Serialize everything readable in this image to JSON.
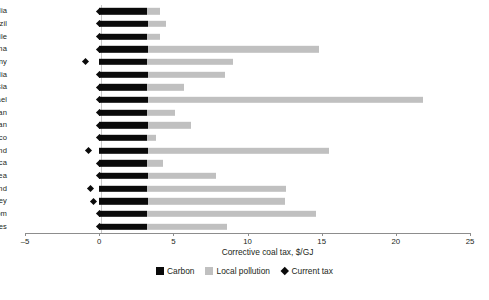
{
  "chart_data": {
    "type": "bar",
    "orientation": "horizontal",
    "stacked": true,
    "title": "",
    "xlabel": "Corrective coal tax, $/GJ",
    "ylabel": "",
    "xlim": [
      -5,
      25
    ],
    "xticks": [
      -5,
      0,
      5,
      10,
      15,
      20,
      25
    ],
    "xticklabels": [
      "–5",
      "0",
      "5",
      "10",
      "15",
      "20",
      "25"
    ],
    "grid": false,
    "legend_position": "bottom",
    "categories": [
      "Australia",
      "Brazil",
      "Chile",
      "China",
      "Germany",
      "India",
      "Indonesia",
      "Israel",
      "Japan",
      "Kazakhstan",
      "Mexico",
      "Poland",
      "South Africa",
      "South Korea",
      "Thailand",
      "Turkey",
      "United Kingdom",
      "United States"
    ],
    "series": [
      {
        "name": "Carbon",
        "color": "#0a0a0a",
        "values": [
          3.2,
          3.3,
          3.2,
          3.3,
          3.2,
          3.3,
          3.2,
          3.3,
          3.2,
          3.3,
          3.2,
          3.3,
          3.2,
          3.3,
          3.2,
          3.3,
          3.2,
          3.2
        ]
      },
      {
        "name": "Local pollution",
        "color": "#c0c0c0",
        "values": [
          0.9,
          1.2,
          0.9,
          11.5,
          5.8,
          5.2,
          2.5,
          18.5,
          1.9,
          2.9,
          0.6,
          12.2,
          1.1,
          4.6,
          9.4,
          9.2,
          11.4,
          5.4
        ]
      }
    ],
    "totals": [
      4.1,
      4.5,
      4.1,
      14.8,
      9.0,
      8.5,
      5.7,
      21.8,
      5.1,
      6.2,
      3.8,
      15.5,
      4.3,
      7.9,
      12.6,
      12.5,
      14.6,
      8.6
    ],
    "markers": {
      "name": "Current tax",
      "color": "#0a0a0a",
      "values": [
        0,
        0,
        0,
        0,
        -0.9,
        0,
        0,
        0,
        0,
        0,
        0,
        -0.75,
        0,
        0,
        -0.6,
        -0.4,
        0,
        0
      ]
    },
    "legend": [
      {
        "label": "Carbon",
        "type": "square",
        "color": "#0a0a0a"
      },
      {
        "label": "Local pollution",
        "type": "square",
        "color": "#c0c0c0"
      },
      {
        "label": "Current tax",
        "type": "diamond",
        "color": "#0a0a0a"
      }
    ]
  }
}
